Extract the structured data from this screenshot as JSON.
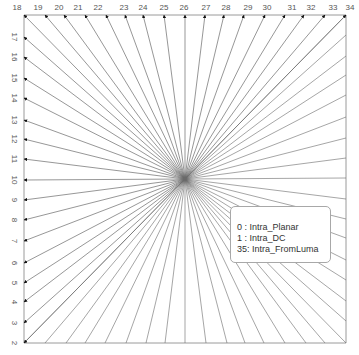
{
  "diagram": {
    "center": [
      185,
      179
    ],
    "frame": {
      "left": 24,
      "top": 15,
      "right": 346,
      "bottom": 343
    },
    "colors": {
      "line": "#6a6a6a",
      "frame": "#9a9a9a",
      "label": "#555555",
      "arrow": "#111111"
    },
    "top_modes": [
      {
        "mode": "18",
        "x": 24,
        "label_x": 17
      },
      {
        "mode": "19",
        "x": 45,
        "label_x": 38
      },
      {
        "mode": "20",
        "x": 64,
        "label_x": 59
      },
      {
        "mode": "21",
        "x": 85,
        "label_x": 78
      },
      {
        "mode": "22",
        "x": 106,
        "label_x": 98
      },
      {
        "mode": "23",
        "x": 125,
        "label_x": 124
      },
      {
        "mode": "24",
        "x": 143,
        "label_x": 143
      },
      {
        "mode": "25",
        "x": 164,
        "label_x": 164
      },
      {
        "mode": "26",
        "x": 185,
        "label_x": 184
      },
      {
        "mode": "27",
        "x": 205,
        "label_x": 206
      },
      {
        "mode": "28",
        "x": 224,
        "label_x": 226
      },
      {
        "mode": "29",
        "x": 244,
        "label_x": 248
      },
      {
        "mode": "30",
        "x": 265,
        "label_x": 267
      },
      {
        "mode": "31",
        "x": 285,
        "label_x": 292
      },
      {
        "mode": "32",
        "x": 304,
        "label_x": 311
      },
      {
        "mode": "33",
        "x": 325,
        "label_x": 333
      },
      {
        "mode": "34",
        "x": 346,
        "label_x": 350
      }
    ],
    "left_modes": [
      {
        "mode": "17",
        "y": 37
      },
      {
        "mode": "16",
        "y": 57
      },
      {
        "mode": "15",
        "y": 78
      },
      {
        "mode": "14",
        "y": 98
      },
      {
        "mode": "13",
        "y": 120
      },
      {
        "mode": "12",
        "y": 139
      },
      {
        "mode": "11",
        "y": 159
      },
      {
        "mode": "10",
        "y": 180
      },
      {
        "mode": "9",
        "y": 200
      },
      {
        "mode": "8",
        "y": 220
      },
      {
        "mode": "7",
        "y": 241
      },
      {
        "mode": "6",
        "y": 263
      },
      {
        "mode": "5",
        "y": 283
      },
      {
        "mode": "4",
        "y": 302
      },
      {
        "mode": "3",
        "y": 323
      },
      {
        "mode": "2",
        "y": 343
      }
    ]
  },
  "legend": {
    "items": [
      {
        "text": "0  : Intra_Planar"
      },
      {
        "text": "1  : Intra_DC"
      },
      {
        "text": "35: Intra_FromLuma"
      }
    ]
  }
}
